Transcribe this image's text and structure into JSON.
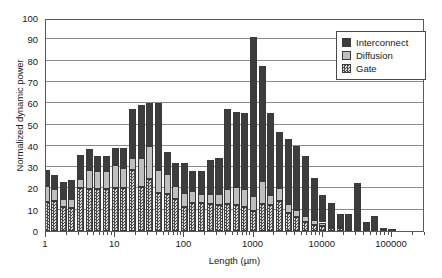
{
  "chart_data": {
    "type": "bar",
    "stacked": true,
    "title": "",
    "xlabel": "Length (µm)",
    "ylabel": "Normalized dynamic power",
    "xscale": "log",
    "xlim": [
      1,
      300000
    ],
    "ylim": [
      0,
      100
    ],
    "ytick_labels": [
      "0",
      "10",
      "20",
      "30",
      "40",
      "50",
      "60",
      "70",
      "80",
      "90",
      "100"
    ],
    "ytick_values": [
      0,
      10,
      20,
      30,
      40,
      50,
      60,
      70,
      80,
      90,
      100
    ],
    "xtick_labels": [
      "1",
      "10",
      "100",
      "1000",
      "10000",
      "100000"
    ],
    "xtick_values": [
      1,
      10,
      100,
      1000,
      10000,
      100000
    ],
    "grid": "horizontal",
    "legend_position": "upper-right",
    "legend": [
      "Interconnect",
      "Diffusion",
      "Gate"
    ],
    "series": [
      {
        "name": "Gate",
        "color": "#a9a9a9",
        "pattern": "checkerboard",
        "values": [
          13.5,
          14.0,
          11.5,
          11.0,
          20.0,
          19.5,
          19.5,
          19.5,
          20.0,
          20.0,
          28.5,
          20.5,
          24.5,
          18.0,
          17.5,
          15.0,
          11.5,
          13.0,
          13.0,
          12.5,
          12.0,
          12.5,
          12.0,
          11.5,
          9.5,
          12.5,
          12.0,
          14.0,
          8.5,
          6.5,
          4.0,
          3.0,
          2.5,
          1.5,
          1.5,
          1.0,
          0.8,
          0.5,
          0.3,
          0.2,
          0.1,
          0.0,
          0.0,
          0.0
        ]
      },
      {
        "name": "Diffusion",
        "color": "#bfbfbf",
        "pattern": "solid",
        "values": [
          7.5,
          5.5,
          3.5,
          4.0,
          4.5,
          9.0,
          8.5,
          8.5,
          11.0,
          9.5,
          6.0,
          14.0,
          15.5,
          10.5,
          9.5,
          6.0,
          6.5,
          6.0,
          4.5,
          5.0,
          5.5,
          7.0,
          8.5,
          8.0,
          7.0,
          11.0,
          5.0,
          6.0,
          4.0,
          3.5,
          3.0,
          2.0,
          1.5,
          1.0,
          0.8,
          0.6,
          0.4,
          0.3,
          0.2,
          0.1,
          0.1,
          0.0,
          0.0,
          0.0
        ]
      },
      {
        "name": "Interconnect",
        "color": "#3d3d3d",
        "pattern": "solid",
        "values": [
          7.5,
          7.0,
          8.0,
          9.0,
          11.0,
          10.0,
          7.0,
          7.0,
          8.0,
          9.5,
          23.0,
          24.5,
          20.0,
          31.5,
          10.0,
          11.0,
          14.0,
          9.0,
          10.5,
          16.0,
          17.0,
          38.0,
          35.5,
          36.0,
          74.5,
          54.0,
          38.5,
          26.5,
          30.5,
          30.0,
          28.0,
          20.0,
          13.0,
          10.5,
          5.5,
          6.5,
          21.5,
          3.2,
          6.5,
          0.7,
          0.2,
          0.0,
          0.0,
          0.0
        ]
      }
    ],
    "x": [
      1.0,
      1.33,
      1.78,
      2.37,
      3.16,
      4.22,
      5.62,
      7.5,
      10.0,
      13.3,
      17.8,
      23.7,
      31.6,
      42.2,
      56.2,
      75.0,
      100,
      133,
      178,
      237,
      316,
      422,
      562,
      750,
      1000,
      1330,
      1780,
      2370,
      3160,
      4220,
      5620,
      7500,
      10000,
      13300,
      17800,
      23700,
      31600,
      42200,
      56200,
      75000,
      100000,
      133000,
      178000,
      237000
    ],
    "totals": [
      28.5,
      26.5,
      23.0,
      24.0,
      35.5,
      38.5,
      35.0,
      35.0,
      39.0,
      39.0,
      57.5,
      59.0,
      60.0,
      60.0,
      37.0,
      32.0,
      32.0,
      28.0,
      28.0,
      33.5,
      34.5,
      57.5,
      56.0,
      55.5,
      91.0,
      77.5,
      55.5,
      46.5,
      43.0,
      40.0,
      35.0,
      25.0,
      17.0,
      13.0,
      7.8,
      8.1,
      22.7,
      4.0,
      7.0,
      1.0,
      0.4,
      0.0,
      0.0,
      0.0
    ]
  }
}
